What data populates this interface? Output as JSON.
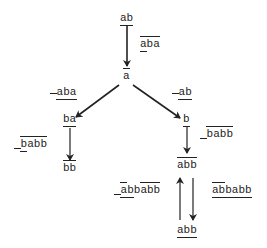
{
  "diagram": {
    "type": "rewriting-graph",
    "nodes": [
      {
        "id": "n_ab",
        "text": "ab",
        "marks": "underline",
        "x": 127,
        "y": 18
      },
      {
        "id": "n_a",
        "text": "a",
        "marks": "overline",
        "x": 127,
        "y": 78
      },
      {
        "id": "n_ba",
        "text": "ba",
        "marks": "underline",
        "x": 64,
        "y": 117
      },
      {
        "id": "n_bb",
        "text": "bb",
        "marks": "overline",
        "x": 64,
        "y": 171
      },
      {
        "id": "n_b",
        "text": "b",
        "marks": "underline",
        "x": 187,
        "y": 117
      },
      {
        "id": "n_abb1",
        "text": "abb",
        "marks": "overline",
        "x": 187,
        "y": 161
      },
      {
        "id": "n_abb2",
        "text": "abb",
        "marks": "underline",
        "x": 187,
        "y": 227
      }
    ],
    "edge_labels": [
      {
        "id": "e1",
        "text": "aba",
        "desc": "overline over 'aba'",
        "x": 139,
        "y": 44
      },
      {
        "id": "e2",
        "text": "aba",
        "desc": "overline before, underline under 'aba'",
        "x": 51,
        "y": 87
      },
      {
        "id": "e3",
        "text": "ab",
        "desc": "overline before, underline under 'ab'",
        "x": 171,
        "y": 87
      },
      {
        "id": "e4",
        "text": "babb",
        "desc": "overline over 'babb', underline before",
        "x": 13,
        "y": 143
      },
      {
        "id": "e5",
        "text": "babb",
        "desc": "overline over 'babb', underline before",
        "x": 199,
        "y": 133
      },
      {
        "id": "e6",
        "text": "abbabb",
        "desc": "overlines over 'a' and 'babb', underline before and under 'ab'",
        "x": 114,
        "y": 188
      },
      {
        "id": "e7",
        "text": "abbabb",
        "desc": "overline over 'ab', underlines under 'abb' and 'abb'",
        "x": 205,
        "y": 188
      }
    ],
    "edges": [
      {
        "from": "n_ab",
        "to": "n_a",
        "label": "e1"
      },
      {
        "from": "n_a",
        "to": "n_ba",
        "label": "e2"
      },
      {
        "from": "n_a",
        "to": "n_b",
        "label": "e3"
      },
      {
        "from": "n_ba",
        "to": "n_bb",
        "label": "e4"
      },
      {
        "from": "n_b",
        "to": "n_abb1",
        "label": "e5"
      },
      {
        "from": "n_abb2",
        "to": "n_abb1",
        "label": "e6"
      },
      {
        "from": "n_abb1",
        "to": "n_abb2",
        "label": "e7"
      }
    ],
    "colors": {
      "ink": "#222222",
      "background": "#ffffff"
    }
  }
}
